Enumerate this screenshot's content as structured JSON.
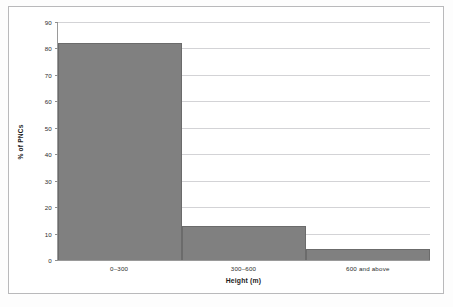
{
  "chart_data": {
    "type": "bar",
    "title": "",
    "subtitle": "",
    "categories": [
      "0–300",
      "300–600",
      "600 and above"
    ],
    "values": [
      82,
      13,
      4
    ],
    "xlabel": "Height (m)",
    "ylabel": "% of PNCs",
    "ylim": [
      0,
      90
    ],
    "yticks": [
      0,
      10,
      20,
      30,
      40,
      50,
      60,
      70,
      80,
      90
    ],
    "ytick_labels": [
      "0",
      "10",
      "20",
      "30",
      "40",
      "50",
      "60",
      "70",
      "80",
      "90"
    ],
    "grid": true,
    "grid_axis": "y",
    "legend": false,
    "legend_position": "none",
    "bar_color": "#808080",
    "bar_edge_color": "#6b6b6b",
    "gridline_color": "#d3d3d6",
    "axis_color": "#9a9a9a",
    "frame_color": "#b9b9bb",
    "background_color": "#ffffff",
    "text_color": "#2b2b2b"
  }
}
